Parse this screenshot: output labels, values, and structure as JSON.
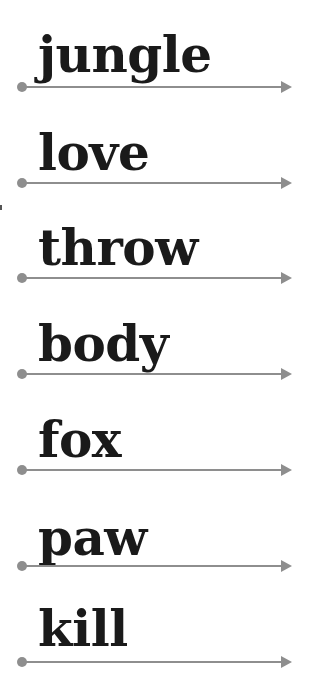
{
  "worksheet": {
    "words": [
      {
        "text": "jungle",
        "line_y": 87
      },
      {
        "text": "love",
        "line_y": 183
      },
      {
        "text": "throw",
        "line_y": 278
      },
      {
        "text": "body",
        "line_y": 374
      },
      {
        "text": "fox",
        "line_y": 470
      },
      {
        "text": "paw",
        "line_y": 566
      },
      {
        "text": "kill",
        "line_y": 662
      }
    ],
    "colors": {
      "text": "#1a1a1a",
      "line": "#8e8e8e",
      "background": "#ffffff"
    }
  }
}
